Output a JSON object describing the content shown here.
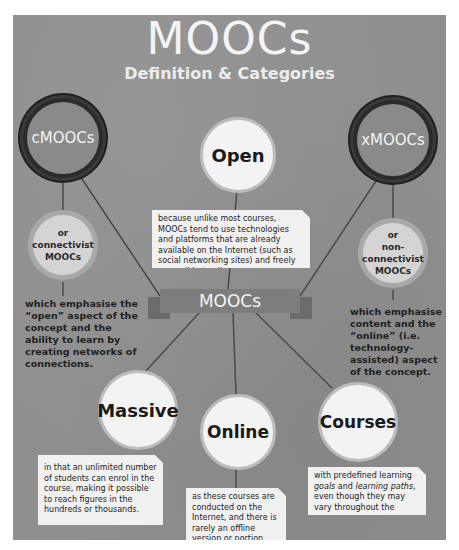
{
  "header": {
    "title": "MOOCs",
    "subtitle": "Definition & Categories"
  },
  "center_banner": {
    "label": "MOOCs"
  },
  "categories": {
    "left": {
      "badge": "cMOOCs",
      "alias_lines": [
        "or",
        "connectivist",
        "MOOCs"
      ],
      "description": "which emphasise the “open” aspect of the concept and the ability to learn by creating networks of connections."
    },
    "right": {
      "badge": "xMOOCs",
      "alias_lines": [
        "or",
        "non-",
        "connectivist",
        "MOOCs"
      ],
      "description": "which emphasise content and the “online” (i.e. technology-assisted) aspect of the concept."
    }
  },
  "definition_terms": [
    {
      "term": "Open",
      "description": "because unlike most courses, MOOCs tend to use technologies and platforms that are already available on the Internet (such as social networking sites) and freely accessible to all."
    },
    {
      "term": "Massive",
      "description": "in that an unlimited number of students can enrol in the course, making it possible to reach figures in the hundreds or thousands."
    },
    {
      "term": "Online",
      "description": "as these courses are conducted on the Internet, and there is rarely an offline version or portion."
    },
    {
      "term": "Courses",
      "description_parts": {
        "before": "with predefined learning ",
        "italic1": "goals",
        "mid": " and ",
        "italic2": "learning paths",
        "after": ", even though they may vary throughout the course."
      }
    }
  ],
  "colors": {
    "background": "#8f8f8f",
    "badge_ring": "#2b2b2b",
    "circle_fill": "#f3f3f3",
    "text_dark": "#1f1f1f",
    "text_light": "#f4f4f4"
  }
}
